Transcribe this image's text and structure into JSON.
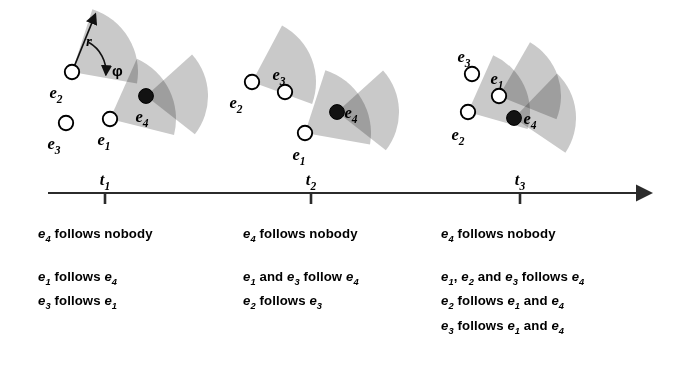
{
  "figure": {
    "kind": "timeline-diagram",
    "axis": {
      "arrow_label": "time-axis-arrow",
      "ticks": [
        {
          "id": "t1",
          "label": "t",
          "sub": "1"
        },
        {
          "id": "t2",
          "label": "t",
          "sub": "2"
        },
        {
          "id": "t3",
          "label": "t",
          "sub": "3"
        }
      ]
    },
    "annotations": {
      "radius_label": "r",
      "angle_label": "φ"
    },
    "entity_labels": {
      "e1": {
        "base": "e",
        "sub": "1"
      },
      "e2": {
        "base": "e",
        "sub": "2"
      },
      "e3": {
        "base": "e",
        "sub": "3"
      },
      "e4": {
        "base": "e",
        "sub": "4"
      }
    },
    "colors": {
      "sector_fill": "#c9c9c9",
      "sector_overlap": "#a3a3a3",
      "node_open_fill": "#ffffff",
      "node_stroke": "#000000",
      "node_filled": "#121212",
      "axis": "#2b2b2b",
      "text": "#000000"
    },
    "panels": [
      {
        "id": "panel-t1",
        "time": "t1",
        "nodes": [
          {
            "id": "e2",
            "type": "open",
            "cx": 72,
            "cy": 72,
            "label_dx": -16,
            "label_dy": 26
          },
          {
            "id": "e3",
            "type": "open",
            "cx": 66,
            "cy": 123,
            "label_dx": -12,
            "label_dy": 26
          },
          {
            "id": "e1",
            "type": "open",
            "cx": 110,
            "cy": 119,
            "label_dx": -6,
            "label_dy": 26
          },
          {
            "id": "e4",
            "type": "filled",
            "cx": 146,
            "cy": 96,
            "label_dx": -4,
            "label_dy": 26
          }
        ],
        "sectors": [
          {
            "owner": "e2",
            "cx": 72,
            "cy": 72,
            "r": 66,
            "start": -72,
            "end": 10
          },
          {
            "owner": "e1",
            "cx": 110,
            "cy": 119,
            "r": 66,
            "start": -66,
            "end": 14
          },
          {
            "owner": "e4",
            "cx": 146,
            "cy": 96,
            "r": 62,
            "start": -42,
            "end": 38
          }
        ]
      },
      {
        "id": "panel-t2",
        "time": "t2",
        "nodes": [
          {
            "id": "e2",
            "type": "open",
            "cx": 252,
            "cy": 82,
            "label_dx": -16,
            "label_dy": 26
          },
          {
            "id": "e3",
            "type": "open",
            "cx": 285,
            "cy": 92,
            "label_dx": -6,
            "label_dy": -12
          },
          {
            "id": "e1",
            "type": "open",
            "cx": 305,
            "cy": 133,
            "label_dx": -6,
            "label_dy": 27
          },
          {
            "id": "e4",
            "type": "filled",
            "cx": 337,
            "cy": 112,
            "label_dx": 14,
            "label_dy": 6
          }
        ],
        "sectors": [
          {
            "owner": "e2",
            "cx": 252,
            "cy": 82,
            "r": 64,
            "start": -62,
            "end": 20
          },
          {
            "owner": "e1",
            "cx": 305,
            "cy": 133,
            "r": 66,
            "start": -72,
            "end": 10
          },
          {
            "owner": "e4",
            "cx": 337,
            "cy": 112,
            "r": 62,
            "start": -42,
            "end": 38
          }
        ]
      },
      {
        "id": "panel-t3",
        "time": "t3",
        "nodes": [
          {
            "id": "e3",
            "type": "open",
            "cx": 472,
            "cy": 74,
            "label_dx": -8,
            "label_dy": -12
          },
          {
            "id": "e2",
            "type": "open",
            "cx": 468,
            "cy": 112,
            "label_dx": -10,
            "label_dy": 28
          },
          {
            "id": "e1",
            "type": "open",
            "cx": 499,
            "cy": 96,
            "label_dx": -2,
            "label_dy": -12
          },
          {
            "id": "e4",
            "type": "filled",
            "cx": 514,
            "cy": 118,
            "label_dx": 16,
            "label_dy": 6
          }
        ],
        "sectors": [
          {
            "owner": "e2",
            "cx": 468,
            "cy": 112,
            "r": 62,
            "start": -66,
            "end": 16
          },
          {
            "owner": "e1",
            "cx": 499,
            "cy": 96,
            "r": 62,
            "start": -60,
            "end": 22
          },
          {
            "owner": "e4",
            "cx": 514,
            "cy": 118,
            "r": 62,
            "start": -46,
            "end": 34
          }
        ]
      }
    ],
    "columns": [
      {
        "id": "column-t1",
        "group_a": [
          "e_4 follows nobody"
        ],
        "group_b": [
          "e_1 follows e_4",
          "e_3 follows e_1"
        ]
      },
      {
        "id": "column-t2",
        "group_a": [
          "e_4 follows nobody"
        ],
        "group_b": [
          "e_1 and e_3 follow e_4",
          "e_2 follows e_3"
        ]
      },
      {
        "id": "column-t3",
        "group_a": [
          "e_4 follows nobody"
        ],
        "group_b": [
          "e_1, e_2 and e_3 follows e_4",
          "e_2 follows e_1 and e_4",
          "e_3 follows e_1 and e_4"
        ]
      }
    ]
  }
}
